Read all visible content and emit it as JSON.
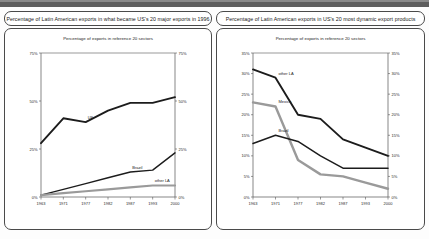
{
  "page": {
    "background": "#fdfdfd",
    "band_color": "#5e5e5e"
  },
  "panels": [
    {
      "id": "left",
      "title": "Percentage of Latin American exports in what became US's 20 major exports in 1996",
      "subtitle": "Percentage of exports in reference 20 sectors"
    },
    {
      "id": "right",
      "title": "Percentage of Latin American exports in US's 20 most dynamic export products",
      "subtitle": "Percentage of exports in reference 20 sectors"
    }
  ],
  "chart_data": [
    {
      "type": "line",
      "id": "left-chart",
      "title": "Percentage of exports in reference 20 sectors",
      "xlabel": "",
      "ylabel": "",
      "x": [
        "1963",
        "1971",
        "1977",
        "1982",
        "1987",
        "1993",
        "2000"
      ],
      "ylim": [
        0,
        75
      ],
      "yticks": [
        0,
        25,
        50,
        75
      ],
      "ytick_labels": [
        "0%",
        "25%",
        "50%",
        "75%"
      ],
      "ytick_labels_right": [
        "0%",
        "25%",
        "50%",
        "75%"
      ],
      "grid": false,
      "legend": "inline-labels",
      "series": [
        {
          "name": "US",
          "color": "#1c1c1c",
          "width": 1.9,
          "label_x": "1977",
          "values": [
            28,
            41,
            39,
            45,
            49,
            49,
            52
          ]
        },
        {
          "name": "Brazil",
          "color": "#1c1c1c",
          "width": 1.4,
          "label_x": "1987",
          "values": [
            1,
            4,
            7,
            10,
            13,
            14,
            23
          ]
        },
        {
          "name": "other LA",
          "color": "#9a9a9a",
          "width": 2.2,
          "label_x": "1993",
          "values": [
            1,
            2,
            3,
            4,
            5,
            6,
            6
          ]
        }
      ]
    },
    {
      "type": "line",
      "id": "right-chart",
      "title": "Percentage of exports in reference 20 sectors",
      "xlabel": "",
      "ylabel": "",
      "x": [
        "1963",
        "1971",
        "1977",
        "1982",
        "1987",
        "1993",
        "2000"
      ],
      "ylim": [
        0,
        35
      ],
      "yticks": [
        0,
        5,
        10,
        15,
        20,
        25,
        30,
        35
      ],
      "ytick_labels": [
        "0%",
        "5%",
        "10%",
        "15%",
        "20%",
        "25%",
        "30%",
        "35%"
      ],
      "ytick_labels_right": [
        "0%",
        "5%",
        "10%",
        "15%",
        "20%",
        "25%",
        "30%",
        "35%"
      ],
      "grid": false,
      "legend": "inline-labels",
      "series": [
        {
          "name": "other LA",
          "color": "#1c1c1c",
          "width": 1.9,
          "label_x": "1971",
          "values": [
            31,
            29,
            20,
            19,
            14,
            12,
            10
          ]
        },
        {
          "name": "Mexico",
          "color": "#9a9a9a",
          "width": 2.4,
          "label_x": "1971",
          "values": [
            23,
            22,
            9,
            5.5,
            5,
            3.5,
            2
          ]
        },
        {
          "name": "Brazil",
          "color": "#1c1c1c",
          "width": 1.5,
          "label_x": "1971",
          "values": [
            13,
            15,
            13.5,
            10,
            7,
            7,
            7
          ]
        }
      ]
    }
  ]
}
